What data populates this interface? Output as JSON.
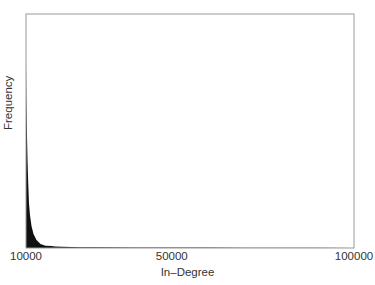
{
  "chart_data": {
    "type": "area",
    "title": "",
    "xlabel": "In–Degree",
    "ylabel": "Frequency",
    "xlim": [
      10000,
      100000
    ],
    "ylim": [
      0,
      1
    ],
    "x_ticks": [
      "10000",
      "50000",
      "100000"
    ],
    "y_ticks": [],
    "grid": false,
    "legend": null,
    "fill_color": "#111111",
    "frame_color": "#999999",
    "series": [
      {
        "name": "In-Degree distribution",
        "x": [
          10000,
          10110,
          10270,
          10410,
          10600,
          10820,
          11100,
          11510,
          12050,
          12870,
          13980,
          15350,
          17000,
          18000,
          20000,
          25000,
          30000,
          40000,
          50000,
          60000,
          70000,
          80000,
          90000,
          100000
        ],
        "y": [
          0.8,
          0.63,
          0.48,
          0.38,
          0.28,
          0.19,
          0.14,
          0.094,
          0.06,
          0.034,
          0.017,
          0.01,
          0.008,
          0.007,
          0.005,
          0.0035,
          0.003,
          0.0025,
          0.002,
          0.0015,
          0.0012,
          0.001,
          0.0008,
          0.0006
        ]
      }
    ]
  },
  "axis": {
    "x_tick_labels": [
      "10000",
      "50000",
      "100000"
    ],
    "xlabel": "In–Degree",
    "ylabel": "Frequency"
  }
}
